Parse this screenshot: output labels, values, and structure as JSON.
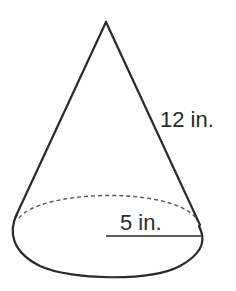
{
  "diagram": {
    "type": "cone",
    "slant_height_label": "12 in.",
    "radius_label": "5 in.",
    "colors": {
      "stroke": "#2a2a2a",
      "dashed": "#555555",
      "background": "#ffffff"
    }
  }
}
